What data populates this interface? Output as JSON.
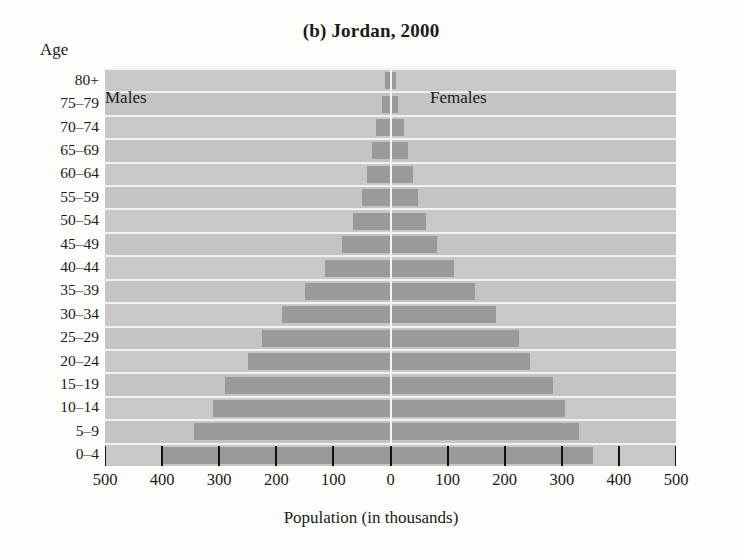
{
  "figure": {
    "title": "(b) Jordan, 2000",
    "y_axis_title": "Age",
    "x_axis_title": "Population (in thousands)"
  },
  "series_labels": {
    "left": "Males",
    "right": "Females"
  },
  "chart_data": {
    "type": "bar",
    "subtype": "population-pyramid",
    "title": "(b) Jordan, 2000",
    "xlabel": "Population (in thousands)",
    "ylabel": "Age",
    "orientation": "horizontal",
    "grid": true,
    "legend_position": "inside-top",
    "xlim": [
      -500,
      500
    ],
    "xtick_values": [
      -500,
      -400,
      -300,
      -200,
      -100,
      0,
      100,
      200,
      300,
      400,
      500
    ],
    "xtick_labels": [
      "500",
      "400",
      "300",
      "200",
      "100",
      "0",
      "100",
      "200",
      "300",
      "400",
      "500"
    ],
    "categories": [
      "0–4",
      "5–9",
      "10–14",
      "15–19",
      "20–24",
      "25–29",
      "30–34",
      "35–39",
      "40–44",
      "45–49",
      "50–54",
      "55–59",
      "60–64",
      "65–69",
      "70–74",
      "75–79",
      "80+"
    ],
    "series": [
      {
        "name": "Males",
        "direction": "left",
        "values": [
          400,
          345,
          310,
          290,
          250,
          225,
          190,
          150,
          115,
          85,
          65,
          50,
          42,
          33,
          25,
          15,
          10
        ]
      },
      {
        "name": "Females",
        "direction": "right",
        "values": [
          355,
          330,
          305,
          285,
          245,
          225,
          185,
          148,
          112,
          82,
          62,
          48,
          40,
          31,
          24,
          14,
          9
        ]
      }
    ]
  },
  "colors": {
    "plot_background": "#c8c8c8",
    "band_alt": "#c4c4c4",
    "bar": "#9a9a9a",
    "gridline": "#f2f2f0",
    "centerline": "#f4f4f2",
    "text": "#1a1a1a",
    "tick": "#111111"
  }
}
